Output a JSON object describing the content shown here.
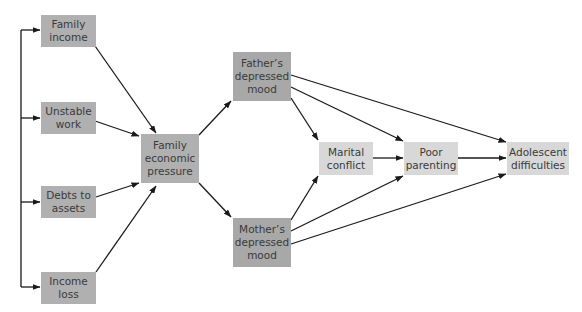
{
  "diagram": {
    "type": "path-model",
    "nodes": {
      "family_income": {
        "label": "Family\nincome"
      },
      "unstable_work": {
        "label": "Unstable\nwork"
      },
      "debts_to_assets": {
        "label": "Debts to\nassets"
      },
      "income_loss": {
        "label": "Income\nloss"
      },
      "family_economic_pressure": {
        "label": "Family\neconomic\npressure"
      },
      "fathers_depressed_mood": {
        "label": "Father’s\ndepressed\nmood"
      },
      "mothers_depressed_mood": {
        "label": "Mother’s\ndepressed\nmood"
      },
      "marital_conflict": {
        "label": "Marital\nconflict"
      },
      "poor_parenting": {
        "label": "Poor\nparenting"
      },
      "adolescent_difficulties": {
        "label": "Adolescent\ndifficulties"
      }
    },
    "edges": [
      [
        "family_income",
        "family_economic_pressure"
      ],
      [
        "unstable_work",
        "family_economic_pressure"
      ],
      [
        "debts_to_assets",
        "family_economic_pressure"
      ],
      [
        "income_loss",
        "family_economic_pressure"
      ],
      [
        "family_economic_pressure",
        "fathers_depressed_mood"
      ],
      [
        "family_economic_pressure",
        "mothers_depressed_mood"
      ],
      [
        "fathers_depressed_mood",
        "marital_conflict"
      ],
      [
        "fathers_depressed_mood",
        "poor_parenting"
      ],
      [
        "fathers_depressed_mood",
        "adolescent_difficulties"
      ],
      [
        "mothers_depressed_mood",
        "marital_conflict"
      ],
      [
        "mothers_depressed_mood",
        "poor_parenting"
      ],
      [
        "mothers_depressed_mood",
        "adolescent_difficulties"
      ],
      [
        "marital_conflict",
        "poor_parenting"
      ],
      [
        "poor_parenting",
        "adolescent_difficulties"
      ]
    ],
    "colors": {
      "line": "#1a1a1a",
      "box_mid": "#b0b0b0",
      "box_dark": "#a8a8a8",
      "box_light": "#d8d8d8"
    }
  }
}
